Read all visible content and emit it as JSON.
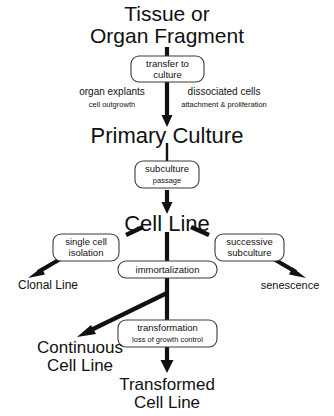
{
  "diagram": {
    "background_color": "#ffffff",
    "ink_color": "#111111",
    "box_stroke_color": "#3b3b3b",
    "stages": {
      "source": {
        "line1": "Tissue or",
        "line2": "Organ Fragment"
      },
      "primary_culture": {
        "label": "Primary Culture"
      },
      "cell_line": {
        "label": "Cell Line"
      }
    },
    "process_boxes": {
      "transfer": {
        "line1": "transfer to",
        "line2": "culture"
      },
      "subculture": {
        "line1": "subculture",
        "line2": "passage"
      },
      "immortalization": {
        "line1": "immortalization"
      },
      "single_cell_isolation": {
        "line1": "single cell",
        "line2": "isolation"
      },
      "successive_subculture": {
        "line1": "successive",
        "line2": "subculture"
      },
      "transformation": {
        "line1": "transformation",
        "line2": "loss of growth control"
      }
    },
    "route_annotations": {
      "left": {
        "title": "organ explants",
        "subtitle": "cell outgrowth"
      },
      "right": {
        "title": "dissociated cells",
        "subtitle": "attachment & proliferation"
      }
    },
    "outcomes": {
      "clonal_line": {
        "label": "Clonal Line"
      },
      "senescence": {
        "label": "senescence"
      },
      "continuous_cell_line": {
        "line1": "Continuous",
        "line2": "Cell Line"
      },
      "transformed_cell_line": {
        "line1": "Transformed",
        "line2": "Cell Line"
      }
    }
  }
}
